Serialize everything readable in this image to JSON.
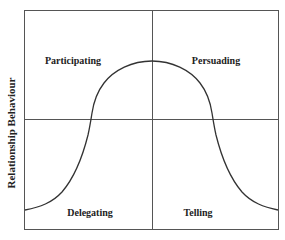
{
  "diagram": {
    "y_axis_label": "Relationship Behaviour",
    "quadrants": {
      "top_left": "Participating",
      "top_right": "Persuading",
      "bottom_left": "Delegating",
      "bottom_right": "Telling"
    },
    "colors": {
      "line": "#555555",
      "curve": "#333333",
      "text": "#222222",
      "background": "#ffffff"
    }
  }
}
